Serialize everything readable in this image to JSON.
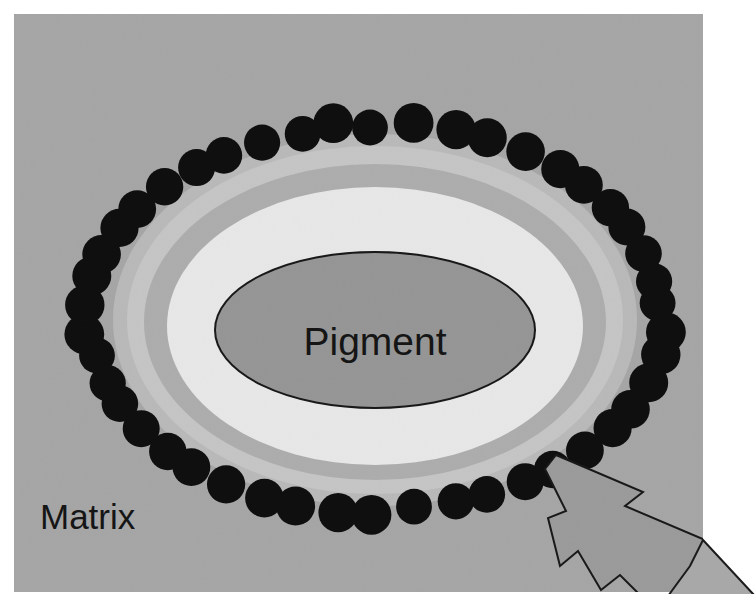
{
  "figure": {
    "width": 755,
    "height": 608,
    "page_background": "#ffffff"
  },
  "panel": {
    "name": "diagram-panel",
    "x": 14,
    "y": 14,
    "width": 689,
    "height": 578,
    "fill": "#b4b4b4"
  },
  "labels": {
    "pigment": "Pigment",
    "matrix": "Matrix"
  },
  "caption": {
    "text": "",
    "visible_fragment": ""
  },
  "colors": {
    "panel_gray": "#b4b4b4",
    "halo_outer_light": "#cfcfcf",
    "halo_band_mid": "#b9b9b9",
    "halo_inner_white": "#fbfbfb",
    "pigment_fill": "#a3a3a3",
    "pigment_stroke": "#1b1b1b",
    "particle_fill": "#101010",
    "arrow_fill": "#a8a8a8",
    "arrow_stroke": "#1b1b1b",
    "text_color": "#151515"
  },
  "halo_rings": [
    {
      "name": "halo-ring-outer",
      "rx": 262,
      "ry": 186,
      "fill": "#cccccc"
    },
    {
      "name": "halo-ring-second",
      "rx": 246,
      "ry": 172,
      "fill": "#d8d8d8"
    },
    {
      "name": "halo-ring-band",
      "rx": 228,
      "ry": 156,
      "fill": "#bdbdbd"
    },
    {
      "name": "halo-ring-inner-white",
      "rx": 206,
      "ry": 138,
      "fill": "#fcfcfc"
    }
  ],
  "pigment_core": {
    "name": "pigment-core-ellipse",
    "cx": 375,
    "cy": 330,
    "rx": 160,
    "ry": 78,
    "fill": "#a3a3a3",
    "stroke": "#1b1b1b",
    "stroke_width": 2
  },
  "particle_ring": {
    "name": "particle-ring",
    "count": 46,
    "center_x": 375,
    "center_y": 318,
    "radius_x": 288,
    "radius_y": 194,
    "particle_radius": 19,
    "fill": "#101010"
  },
  "arrow": {
    "name": "lightning-arrow",
    "fill": "#a8a8a8",
    "stroke": "#1b1b1b",
    "stroke_width": 2,
    "points": "556,455 643,492 625,506 717,545 698,562 755,596 712,607 652,607 620,575 601,590 578,551 560,566 548,518 566,511 545,469"
  }
}
